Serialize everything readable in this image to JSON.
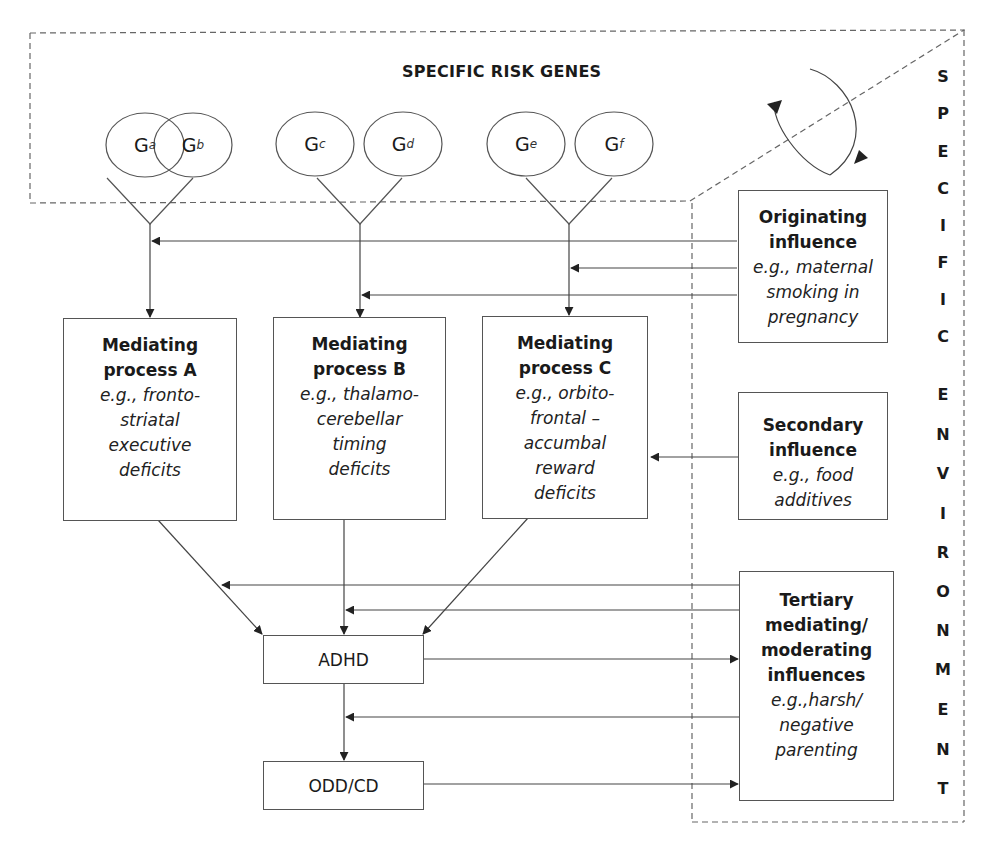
{
  "genes_region": {
    "title": "SPECIFIC RISK GENES"
  },
  "environment_region": {
    "letters": [
      "S",
      "P",
      "E",
      "C",
      "I",
      "F",
      "I",
      "C",
      "E",
      "N",
      "V",
      "I",
      "R",
      "O",
      "N",
      "M",
      "E",
      "N",
      "T"
    ],
    "label": "SPECIFIC ENVIRONMENT"
  },
  "genes": [
    {
      "base": "G",
      "sub": "a"
    },
    {
      "base": "G",
      "sub": "b"
    },
    {
      "base": "G",
      "sub": "c"
    },
    {
      "base": "G",
      "sub": "d"
    },
    {
      "base": "G",
      "sub": "e"
    },
    {
      "base": "G",
      "sub": "f"
    }
  ],
  "mediating": [
    {
      "title1": "Mediating",
      "title2": "process A",
      "ex": [
        "e.g., fronto-",
        "striatal",
        "executive",
        "deficits"
      ]
    },
    {
      "title1": "Mediating",
      "title2": "process B",
      "ex": [
        "e.g., thalamo-",
        "cerebellar",
        "timing",
        "deficits"
      ]
    },
    {
      "title1": "Mediating",
      "title2": "process C",
      "ex": [
        "e.g., orbito-",
        "frontal –",
        "accumbal",
        "reward",
        "deficits"
      ]
    }
  ],
  "influences": {
    "originating": {
      "title": [
        "Originating",
        "influence"
      ],
      "ex": [
        "e.g., maternal",
        "smoking in",
        "pregnancy"
      ]
    },
    "secondary": {
      "title": [
        "Secondary",
        "influence"
      ],
      "ex": [
        "e.g., food",
        "additives"
      ]
    },
    "tertiary": {
      "title": [
        "Tertiary",
        "mediating/",
        "moderating",
        "influences"
      ],
      "ex": [
        "e.g.,harsh/",
        "negative",
        "parenting"
      ]
    }
  },
  "outcomes": {
    "adhd": "ADHD",
    "odd_cd": "ODD/CD"
  },
  "colors": {
    "line": "#555555",
    "text": "#1a1a1a",
    "background": "#ffffff"
  }
}
